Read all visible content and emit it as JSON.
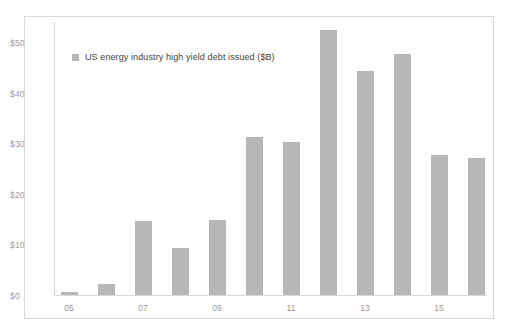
{
  "chart_data": {
    "type": "bar",
    "title": "",
    "subtitle": "",
    "xlabel": "",
    "ylabel": "",
    "categories": [
      "05",
      "06",
      "07",
      "08",
      "09",
      "10",
      "11",
      "12",
      "13",
      "14",
      "15",
      "16"
    ],
    "tick_labels_shown": [
      "05",
      "07",
      "09",
      "11",
      "13",
      "15"
    ],
    "values": [
      0.6,
      2.2,
      14.7,
      9.3,
      14.8,
      31.2,
      30.2,
      52.4,
      44.3,
      47.7,
      27.6,
      27.1
    ],
    "series": [
      {
        "name": "US energy industry high yield debt issued ($B)",
        "values": [
          0.6,
          2.2,
          14.7,
          9.3,
          14.8,
          31.2,
          30.2,
          52.4,
          44.3,
          47.7,
          27.6,
          27.1
        ]
      }
    ],
    "ylim": [
      0,
      50
    ],
    "yticks": [
      0,
      10,
      20,
      30,
      40,
      50
    ],
    "ytick_labels": [
      "$0",
      "$10",
      "$20",
      "$30",
      "$40",
      "$50"
    ],
    "grid": false,
    "legend_position": "top-left-inside",
    "bar_color": "#b7b7b7",
    "axis_color": "#d9d9d9",
    "tick_label_color": "#9a9a9a",
    "legend_text_color": "#3f3f3f",
    "border_color": "#d9d9d9",
    "background": "#ffffff"
  },
  "legend": {
    "label": "US energy industry high yield debt issued ($B)"
  }
}
